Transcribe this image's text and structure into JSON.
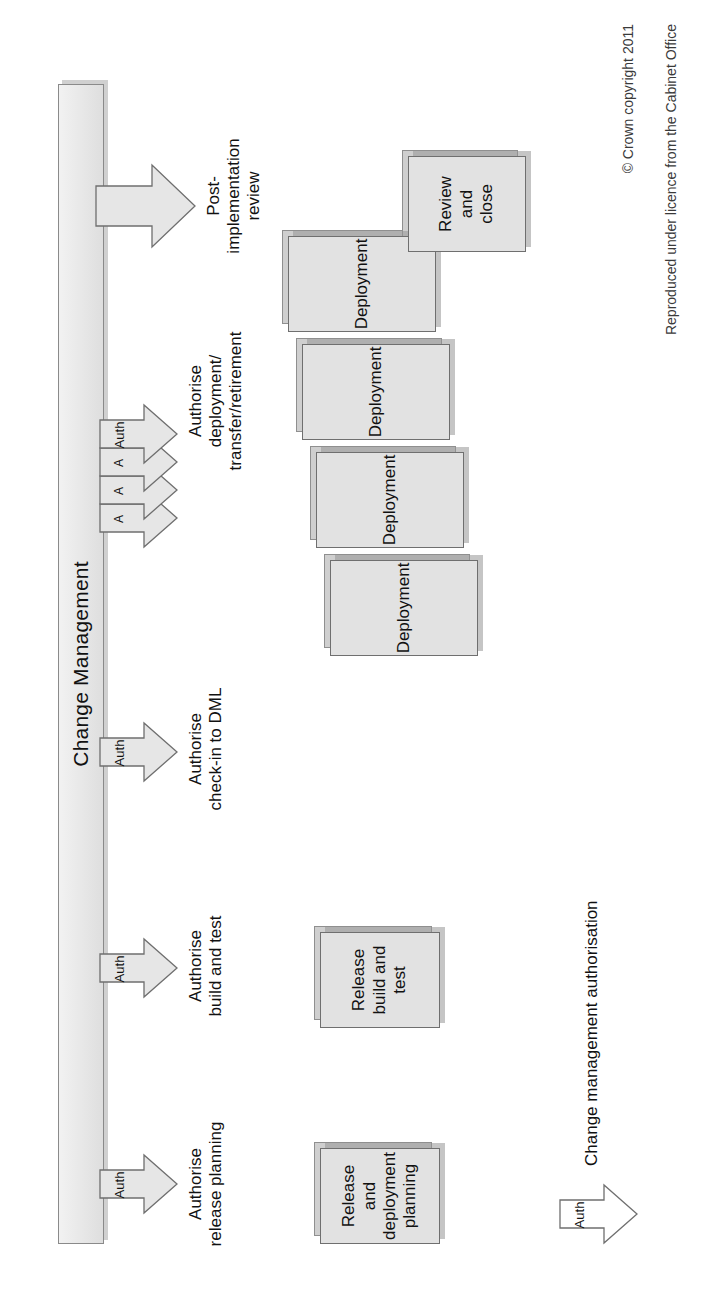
{
  "diagram": {
    "lane": {
      "title": "Change Management"
    },
    "authorisations": [
      {
        "id": "authorise-release-planning",
        "badge": "Auth",
        "caption": "Authorise\nrelease planning"
      },
      {
        "id": "authorise-build-and-test",
        "badge": "Auth",
        "caption": "Authorise\nbuild and test"
      },
      {
        "id": "authorise-check-in-to-dml",
        "badge": "Auth",
        "caption": "Authorise\ncheck-in to DML"
      },
      {
        "id": "authorise-deployment",
        "badge": "Auth",
        "caption": "Authorise\ndeployment/\ntransfer/retirement",
        "stacked_badges": [
          "A",
          "A",
          "A",
          "Auth"
        ]
      },
      {
        "id": "post-implementation-review",
        "badge": "",
        "caption": "Post-\nimplementation\nreview"
      }
    ],
    "stages": [
      {
        "id": "release-and-deployment-planning",
        "label": "Release and\ndeployment\nplanning"
      },
      {
        "id": "release-build-and-test",
        "label": "Release\nbuild and\ntest"
      },
      {
        "id": "deployment-1",
        "label": "Deployment"
      },
      {
        "id": "deployment-2",
        "label": "Deployment"
      },
      {
        "id": "deployment-3",
        "label": "Deployment"
      },
      {
        "id": "deployment-4",
        "label": "Deployment"
      },
      {
        "id": "review-and-close",
        "label": "Review\nand\nclose"
      }
    ],
    "legend": {
      "badge": "Auth",
      "label": "Change management authorisation"
    },
    "copyright": {
      "line1": "© Crown copyright 2011",
      "line2": "Reproduced under licence from the Cabinet Office"
    },
    "colors": {
      "bar_fill": "#ececec",
      "bar_stroke": "#8a8a8a",
      "box_fill": "#e2e2e2",
      "box_stroke": "#6f6f6f",
      "shadow": "#cfcfcf",
      "text": "#111111"
    }
  }
}
